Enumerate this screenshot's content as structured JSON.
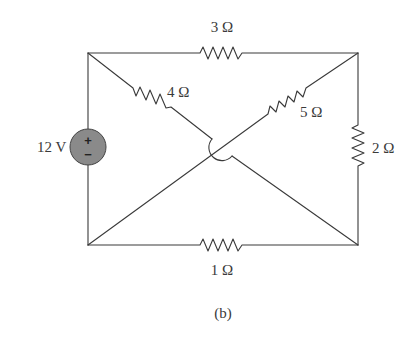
{
  "figure": {
    "caption": "(b)",
    "source": {
      "label": "12 V",
      "plus": "+",
      "minus": "−",
      "fill": "#8a8a8a"
    },
    "resistors": [
      {
        "id": "r-top",
        "label": "3 Ω"
      },
      {
        "id": "r-diag-left",
        "label": "4 Ω"
      },
      {
        "id": "r-diag-right",
        "label": "5 Ω"
      },
      {
        "id": "r-right",
        "label": "2 Ω"
      },
      {
        "id": "r-bottom",
        "label": "1 Ω"
      }
    ]
  }
}
